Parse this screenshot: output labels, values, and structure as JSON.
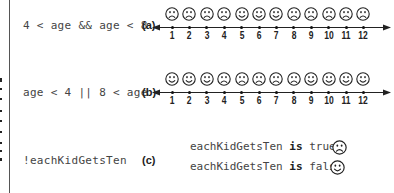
{
  "rows": [
    {
      "expression": "4 < age && age < 8",
      "tag": "(a)",
      "faces": [
        "sad",
        "sad",
        "sad",
        "sad",
        "happy",
        "happy",
        "happy",
        "sad",
        "sad",
        "sad",
        "sad",
        "sad"
      ]
    },
    {
      "expression": "age < 4 || 8 < age",
      "tag": "(b)",
      "faces": [
        "happy",
        "happy",
        "happy",
        "sad",
        "sad",
        "sad",
        "sad",
        "sad",
        "happy",
        "happy",
        "happy",
        "happy"
      ]
    },
    {
      "expression": "!eachKidGetsTen",
      "tag": "(c)",
      "statements": [
        {
          "subject": "eachKidGetsTen",
          "verb": "is",
          "value": "true",
          "face": "sad"
        },
        {
          "subject": "eachKidGetsTen",
          "verb": "is",
          "value": "false",
          "face": "happy"
        }
      ]
    }
  ],
  "axis_ticks": [
    "1",
    "2",
    "3",
    "4",
    "5",
    "6",
    "7",
    "8",
    "9",
    "10",
    "11",
    "12"
  ],
  "colors": {
    "ink": "#222222",
    "text": "#444444",
    "background": "#ffffff"
  }
}
